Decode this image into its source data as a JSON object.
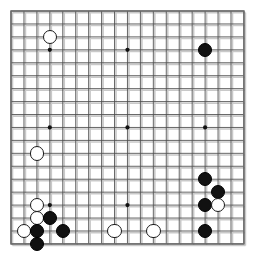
{
  "board": {
    "type": "go-board",
    "size": 19,
    "label": "Go board diagram",
    "grid": {
      "origin_x": 11,
      "origin_y": 11,
      "spacing": 12.94,
      "line_color": "#4a4a4a",
      "border_color": "#6b6b6b",
      "background_color": "#ffffff",
      "shadow_color": "#c9c9c9"
    },
    "star_points": [
      {
        "col": 3,
        "row": 3
      },
      {
        "col": 9,
        "row": 3
      },
      {
        "col": 15,
        "row": 3
      },
      {
        "col": 3,
        "row": 9
      },
      {
        "col": 9,
        "row": 9
      },
      {
        "col": 15,
        "row": 9
      },
      {
        "col": 3,
        "row": 15
      },
      {
        "col": 9,
        "row": 15
      },
      {
        "col": 15,
        "row": 15
      }
    ],
    "stone_colors": {
      "black": "#111111",
      "white": "#ffffff",
      "white_outline": "#1a1a1a"
    },
    "stone_radius": 7.2,
    "stones": [
      {
        "col": 3,
        "row": 2,
        "color": "white"
      },
      {
        "col": 15,
        "row": 3,
        "color": "black"
      },
      {
        "col": 2,
        "row": 11,
        "color": "white"
      },
      {
        "col": 15,
        "row": 13,
        "color": "black"
      },
      {
        "col": 16,
        "row": 14,
        "color": "black"
      },
      {
        "col": 15,
        "row": 15,
        "color": "black"
      },
      {
        "col": 16,
        "row": 15,
        "color": "white"
      },
      {
        "col": 2,
        "row": 15,
        "color": "white"
      },
      {
        "col": 2,
        "row": 16,
        "color": "white"
      },
      {
        "col": 3,
        "row": 16,
        "color": "black"
      },
      {
        "col": 1,
        "row": 17,
        "color": "white"
      },
      {
        "col": 2,
        "row": 17,
        "color": "black"
      },
      {
        "col": 4,
        "row": 17,
        "color": "black"
      },
      {
        "col": 8,
        "row": 17,
        "color": "white"
      },
      {
        "col": 11,
        "row": 17,
        "color": "white"
      },
      {
        "col": 15,
        "row": 17,
        "color": "black"
      },
      {
        "col": 2,
        "row": 18,
        "color": "black"
      }
    ]
  }
}
